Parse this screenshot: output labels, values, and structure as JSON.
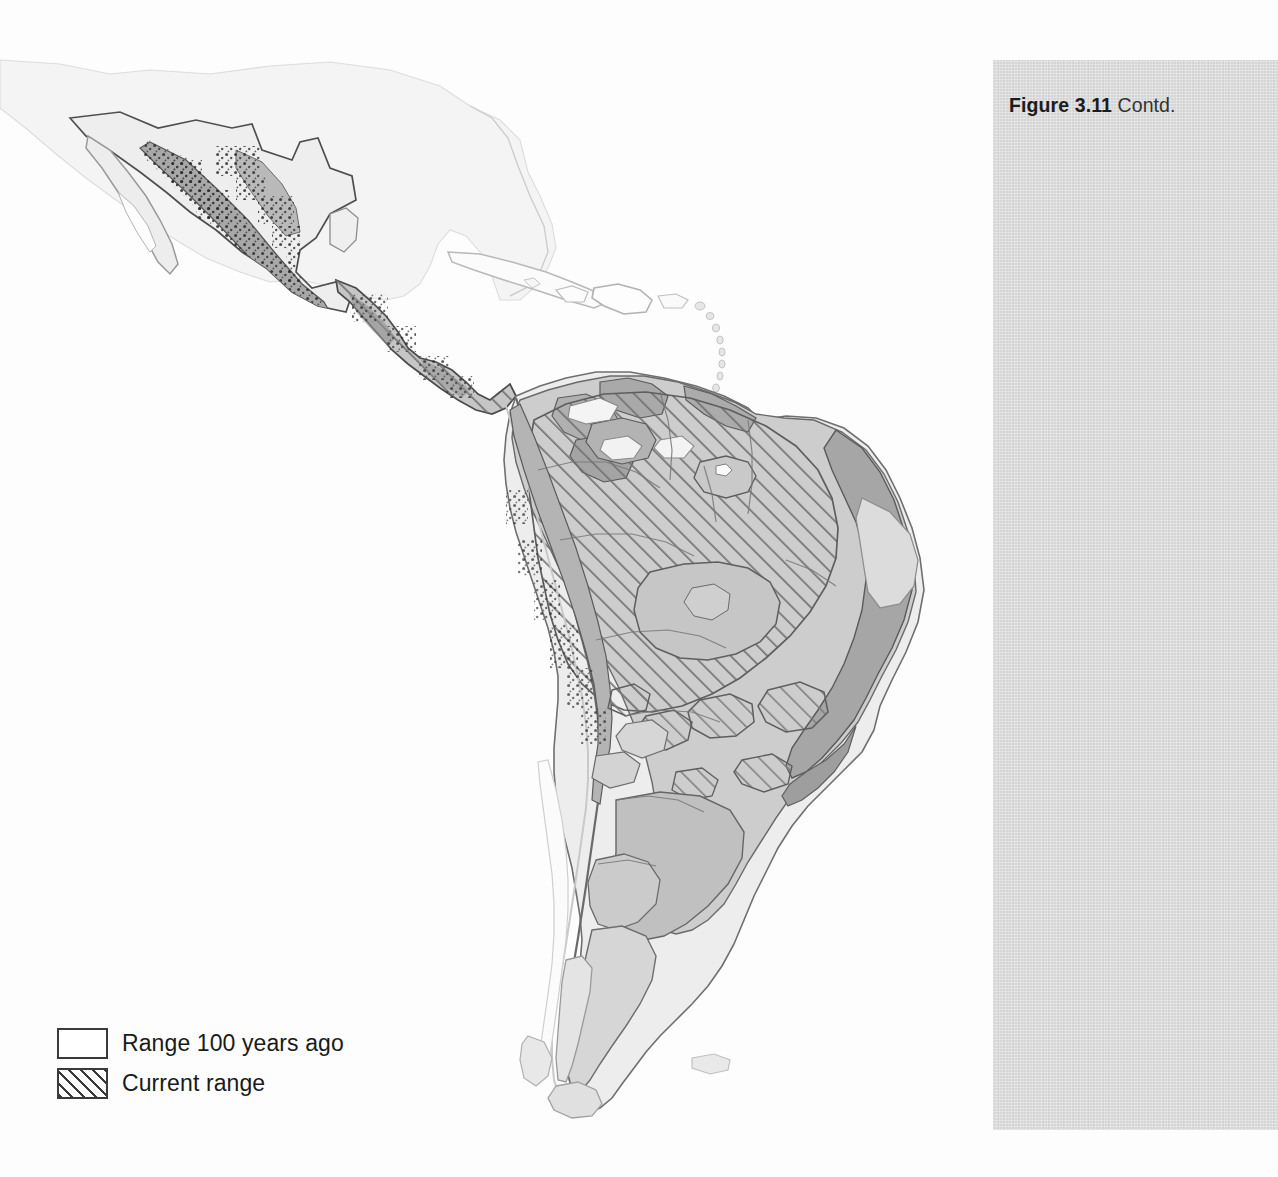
{
  "figure": {
    "number_label": "Figure 3.11",
    "continued_label": "Contd."
  },
  "legend": {
    "items": [
      {
        "swatch": "open-rectangle",
        "label": "Range 100 years ago"
      },
      {
        "swatch": "hatched-rectangle",
        "label": "Current range"
      }
    ]
  },
  "map": {
    "title": "",
    "region": "Latin America",
    "projection": "equirectangular",
    "colors": {
      "page_background": "#fdfdfd",
      "panel_background": "#d6d6d6",
      "land_outside_range": "#f0f0f0",
      "historic_range_light": "#d2d2d2",
      "historic_range_mid": "#c0c0c0",
      "historic_range_dark": "#a6a6a6",
      "coastline_faint": "#cfcfcf",
      "outline": "#4a4a4a",
      "hatch": "#6a6a6a",
      "text": "#1a1a1a"
    },
    "hatch_angle_degrees": 45,
    "landmasses": [
      "United States (southern edge, faint)",
      "Mexico",
      "Baja California",
      "Central America",
      "Cuba",
      "Hispaniola",
      "Jamaica",
      "Puerto Rico",
      "Lesser Antilles",
      "Colombia",
      "Venezuela",
      "Guianas",
      "Ecuador",
      "Peru",
      "Brazil",
      "Bolivia",
      "Paraguay",
      "Uruguay",
      "Argentina",
      "Chile",
      "Tierra del Fuego",
      "Falkland Islands"
    ]
  }
}
